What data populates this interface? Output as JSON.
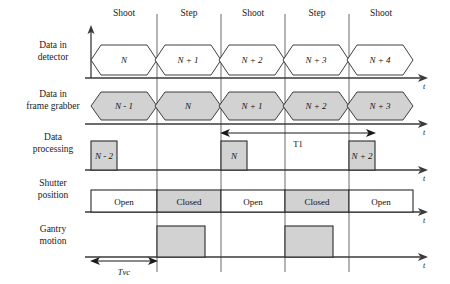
{
  "figure": {
    "type": "timing-diagram",
    "title": "",
    "time_axis_label": "t"
  },
  "columns": {
    "headers": [
      "Shoot",
      "Step",
      "Shoot",
      "Step",
      "Shoot"
    ],
    "boundaries_px": [
      91,
      157,
      221,
      285,
      349,
      413
    ]
  },
  "rows": [
    {
      "key": "detector",
      "label_line1": "Data in",
      "label_line2": "detector"
    },
    {
      "key": "frame_grabber",
      "label_line1": "Data in",
      "label_line2": "frame grabber"
    },
    {
      "key": "processing",
      "label_line1": "Data",
      "label_line2": "processing"
    },
    {
      "key": "shutter",
      "label_line1": "Shutter",
      "label_line2": "position"
    },
    {
      "key": "gantry",
      "label_line1": "Gantry",
      "label_line2": "motion"
    }
  ],
  "detector": {
    "style": "hexagon-outline",
    "packets": [
      "N",
      "N + 1",
      "N + 2",
      "N + 3",
      "N + 4"
    ]
  },
  "frame_grabber": {
    "style": "hexagon-filled",
    "packets": [
      "N - 1",
      "N",
      "N + 1",
      "N + 2",
      "N + 3"
    ]
  },
  "processing": {
    "style": "block-filled",
    "blocks": [
      {
        "label": "N - 2",
        "col": 0
      },
      {
        "label": "N",
        "col": 2
      },
      {
        "label": "N + 2",
        "col": 4
      }
    ]
  },
  "shutter": {
    "style": "block-labeled",
    "states": [
      "Open",
      "Closed",
      "Open",
      "Closed",
      "Open"
    ]
  },
  "gantry": {
    "style": "block-filled-unlabeled",
    "active_columns": [
      1,
      3
    ]
  },
  "annotations": [
    {
      "key": "t1",
      "label": "T1",
      "row": "processing",
      "from_col": 2,
      "to_col": 4,
      "italic": false
    },
    {
      "key": "tvc",
      "label": "Tvc",
      "row": "gantry",
      "from_col": 0,
      "to_col": 0,
      "italic": true
    }
  ],
  "colors": {
    "fill_gray": "#d2d2d2",
    "stroke": "#2a2a2a",
    "axis": "#3a3a3a",
    "divider": "#5a5a5a",
    "background": "#ffffff"
  }
}
